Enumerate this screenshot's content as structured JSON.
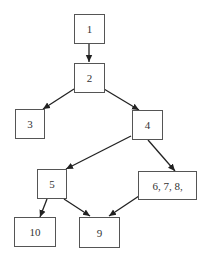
{
  "diagram": {
    "type": "flow-graph",
    "colors": {
      "border": "#555555",
      "edge": "#222222",
      "text": "#333333",
      "background": "#ffffff"
    },
    "nodes": [
      {
        "id": "n1",
        "label": "1",
        "x": 74,
        "y": 14,
        "w": 31,
        "h": 30
      },
      {
        "id": "n2",
        "label": "2",
        "x": 74,
        "y": 63,
        "w": 31,
        "h": 30
      },
      {
        "id": "n3",
        "label": "3",
        "x": 15,
        "y": 109,
        "w": 30,
        "h": 30
      },
      {
        "id": "n4",
        "label": "4",
        "x": 132,
        "y": 110,
        "w": 31,
        "h": 30
      },
      {
        "id": "n5",
        "label": "5",
        "x": 37,
        "y": 169,
        "w": 30,
        "h": 30
      },
      {
        "id": "n678",
        "label": "6, 7, 8,",
        "x": 138,
        "y": 171,
        "w": 59,
        "h": 29
      },
      {
        "id": "n10",
        "label": "10",
        "x": 14,
        "y": 217,
        "w": 42,
        "h": 30
      },
      {
        "id": "n9",
        "label": "9",
        "x": 79,
        "y": 217,
        "w": 41,
        "h": 31
      }
    ],
    "edges": [
      {
        "from": "1",
        "to": "2",
        "x1": 89,
        "y1": 44,
        "x2": 89,
        "y2": 62
      },
      {
        "from": "2",
        "to": "3",
        "x1": 74,
        "y1": 89,
        "x2": 43,
        "y2": 109
      },
      {
        "from": "2",
        "to": "4",
        "x1": 104,
        "y1": 89,
        "x2": 139,
        "y2": 110
      },
      {
        "from": "4",
        "to": "5",
        "x1": 131,
        "y1": 136,
        "x2": 66,
        "y2": 169
      },
      {
        "from": "4",
        "to": "6, 7, 8,",
        "x1": 148,
        "y1": 140,
        "x2": 175,
        "y2": 171
      },
      {
        "from": "5",
        "to": "10",
        "x1": 47,
        "y1": 199,
        "x2": 40,
        "y2": 217
      },
      {
        "from": "5",
        "to": "9",
        "x1": 64,
        "y1": 199,
        "x2": 90,
        "y2": 216
      },
      {
        "from": "6, 7, 8,",
        "to": "9",
        "x1": 139,
        "y1": 196,
        "x2": 109,
        "y2": 216
      }
    ]
  }
}
